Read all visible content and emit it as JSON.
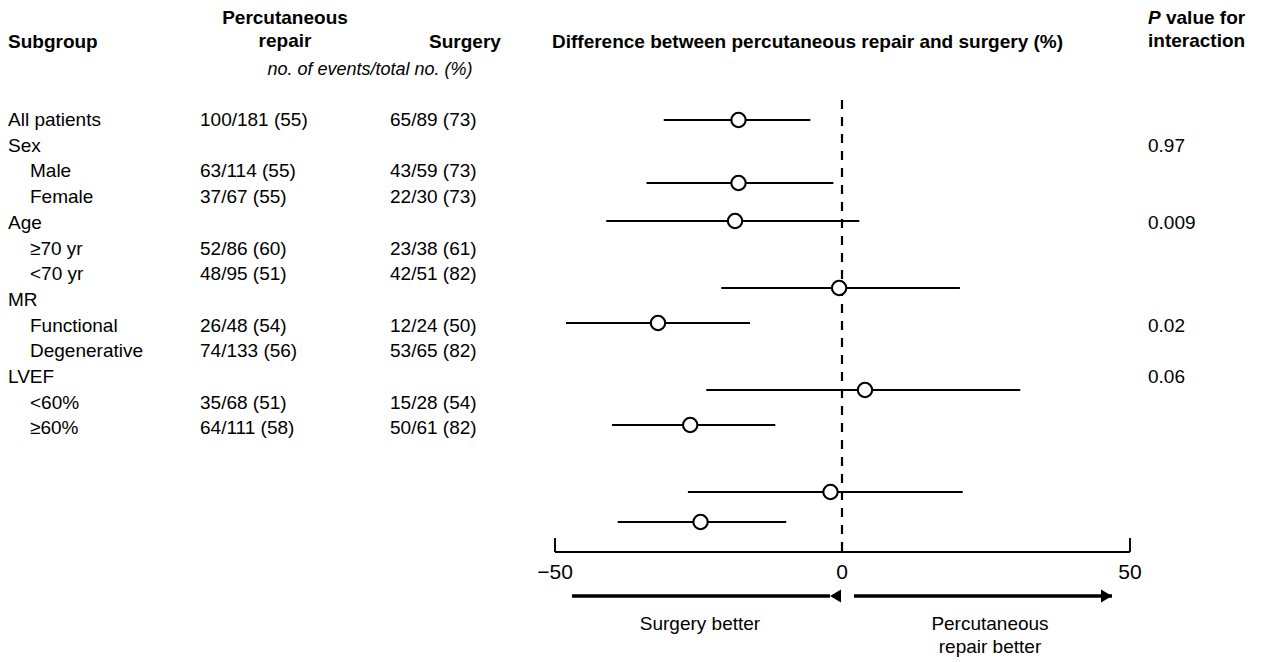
{
  "header": {
    "subgroup": "Subgroup",
    "percutaneous_line1": "Percutaneous",
    "percutaneous_line2": "repair",
    "surgery": "Surgery",
    "units_note": "no. of events/total no. (%)",
    "plot_title": "Difference between percutaneous repair and surgery (%)",
    "pvalue_line1_italic": "P",
    "pvalue_line1_rest": " value for",
    "pvalue_line2": "interaction"
  },
  "rows": [
    {
      "label": "All patients",
      "indent": false,
      "percutaneous": "100/181 (55)",
      "surgery": "65/89 (73)",
      "pvalue": ""
    },
    {
      "label": "Sex",
      "indent": false,
      "percutaneous": "",
      "surgery": "",
      "pvalue": "0.97"
    },
    {
      "label": "Male",
      "indent": true,
      "percutaneous": "63/114 (55)",
      "surgery": "43/59 (73)",
      "pvalue": ""
    },
    {
      "label": "Female",
      "indent": true,
      "percutaneous": "37/67 (55)",
      "surgery": "22/30 (73)",
      "pvalue": ""
    },
    {
      "label": "Age",
      "indent": false,
      "percutaneous": "",
      "surgery": "",
      "pvalue": "0.009"
    },
    {
      "label": "≥70 yr",
      "indent": true,
      "percutaneous": "52/86 (60)",
      "surgery": "23/38 (61)",
      "pvalue": ""
    },
    {
      "label": "<70 yr",
      "indent": true,
      "percutaneous": "48/95 (51)",
      "surgery": "42/51 (82)",
      "pvalue": ""
    },
    {
      "label": "MR",
      "indent": false,
      "percutaneous": "",
      "surgery": "",
      "pvalue": ""
    },
    {
      "label": "Functional",
      "indent": true,
      "percutaneous": "26/48 (54)",
      "surgery": "12/24 (50)",
      "pvalue": "0.02"
    },
    {
      "label": "Degenerative",
      "indent": true,
      "percutaneous": "74/133 (56)",
      "surgery": "53/65 (82)",
      "pvalue": ""
    },
    {
      "label": "LVEF",
      "indent": false,
      "percutaneous": "",
      "surgery": "",
      "pvalue": "0.06"
    },
    {
      "label": "<60%",
      "indent": true,
      "percutaneous": "35/68 (51)",
      "surgery": "15/28 (54)",
      "pvalue": ""
    },
    {
      "label": "≥60%",
      "indent": true,
      "percutaneous": "64/111 (58)",
      "surgery": "50/61 (82)",
      "pvalue": ""
    }
  ],
  "footer": {
    "left_label": "Surgery better",
    "right_label_line1": "Percutaneous",
    "right_label_line2": "repair better"
  },
  "colors": {
    "ink": "#000000",
    "background": "#ffffff"
  },
  "chart_data": {
    "type": "forest",
    "title": "Difference between percutaneous repair and surgery (%)",
    "xlabel": "Difference between percutaneous repair and surgery (%)",
    "ylabel": "",
    "xlim": [
      -50,
      50
    ],
    "xticks": [
      -50,
      0,
      50
    ],
    "xticklabels": [
      "−50",
      "0",
      "50"
    ],
    "grid": false,
    "reference_line": 0,
    "reference_line_style": "dashed",
    "marker": "open-circle",
    "left_direction_label": "Surgery better",
    "right_direction_label": "Percutaneous repair better",
    "points": [
      {
        "subgroup": "All patients",
        "estimate": -18.0,
        "ci_low": -31.0,
        "ci_high": -5.5,
        "y_px": 120
      },
      {
        "subgroup": "Male",
        "estimate": -18.0,
        "ci_low": -34.0,
        "ci_high": -1.5,
        "y_px": 183
      },
      {
        "subgroup": "Female",
        "estimate": -18.6,
        "ci_low": -41.0,
        "ci_high": 3.0,
        "y_px": 221
      },
      {
        "subgroup": "≥70 yr",
        "estimate": -0.5,
        "ci_low": -21.0,
        "ci_high": 20.5,
        "y_px": 288
      },
      {
        "subgroup": "<70 yr",
        "estimate": -32.0,
        "ci_low": -48.0,
        "ci_high": -16.0,
        "y_px": 323
      },
      {
        "subgroup": "Functional",
        "estimate": 4.0,
        "ci_low": -23.6,
        "ci_high": 31.0,
        "y_px": 390
      },
      {
        "subgroup": "Degenerative",
        "estimate": -26.4,
        "ci_low": -40.0,
        "ci_high": -11.6,
        "y_px": 425
      },
      {
        "subgroup": "<60%",
        "estimate": -2.0,
        "ci_low": -26.8,
        "ci_high": 21.0,
        "y_px": 492
      },
      {
        "subgroup": "≥60%",
        "estimate": -24.6,
        "ci_low": -39.0,
        "ci_high": -9.7,
        "y_px": 522
      }
    ],
    "interaction_p_values": [
      {
        "subgroup": "Sex",
        "p": "0.97"
      },
      {
        "subgroup": "Age",
        "p": "0.009"
      },
      {
        "subgroup": "MR",
        "p": "0.02"
      },
      {
        "subgroup": "LVEF",
        "p": "0.06"
      }
    ]
  }
}
